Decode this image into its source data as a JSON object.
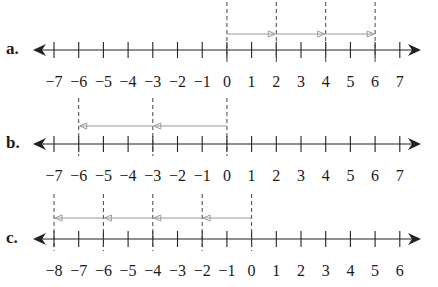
{
  "problems": [
    {
      "label": "a.",
      "axis_y": 50,
      "label_y": 73,
      "ticks": [
        "−7",
        "−6",
        "−5",
        "−4",
        "−3",
        "−2",
        "−1",
        "0",
        "1",
        "2",
        "3",
        "4",
        "5",
        "6",
        "7"
      ],
      "tick_values": [
        -7,
        -6,
        -5,
        -4,
        -3,
        -2,
        -1,
        0,
        1,
        2,
        3,
        4,
        5,
        6,
        7
      ],
      "dashed_at": [
        0,
        2,
        4,
        6
      ],
      "dash_top": 2,
      "dash_bottom": 62,
      "arrow_y": 34,
      "jumps": [
        {
          "from": 0,
          "to": 2
        },
        {
          "from": 2,
          "to": 4
        },
        {
          "from": 4,
          "to": 6
        }
      ]
    },
    {
      "label": "b.",
      "axis_y": 144,
      "label_y": 167,
      "ticks": [
        "−7",
        "−6",
        "−5",
        "−4",
        "−3",
        "−2",
        "−1",
        "0",
        "1",
        "2",
        "3",
        "4",
        "5",
        "6",
        "7"
      ],
      "tick_values": [
        -7,
        -6,
        -5,
        -4,
        -3,
        -2,
        -1,
        0,
        1,
        2,
        3,
        4,
        5,
        6,
        7
      ],
      "dashed_at": [
        -6,
        -3,
        0
      ],
      "dash_top": 98,
      "dash_bottom": 156,
      "arrow_y": 126,
      "jumps": [
        {
          "from": 0,
          "to": -3
        },
        {
          "from": -3,
          "to": -6
        }
      ]
    },
    {
      "label": "c.",
      "axis_y": 239,
      "label_y": 262,
      "ticks": [
        "−8",
        "−7",
        "−6",
        "−5",
        "−4",
        "−3",
        "−2",
        "−1",
        "0",
        "1",
        "2",
        "3",
        "4",
        "5",
        "6"
      ],
      "tick_values": [
        -8,
        -7,
        -6,
        -5,
        -4,
        -3,
        -2,
        -1,
        0,
        1,
        2,
        3,
        4,
        5,
        6
      ],
      "dashed_at": [
        -8,
        -6,
        -4,
        -2,
        0
      ],
      "dash_top": 194,
      "dash_bottom": 251,
      "arrow_y": 218,
      "jumps": [
        {
          "from": 0,
          "to": -2
        },
        {
          "from": -2,
          "to": -4
        },
        {
          "from": -4,
          "to": -6
        },
        {
          "from": -6,
          "to": -8
        }
      ]
    }
  ],
  "layout": {
    "first_tick_x": 54,
    "tick_spacing": 24.7,
    "axis_left_x": 33,
    "axis_right_x": 421
  },
  "colors": {
    "axis": "#222222",
    "dashed": "#444444",
    "jump_arrow": "#9a9a9a"
  }
}
